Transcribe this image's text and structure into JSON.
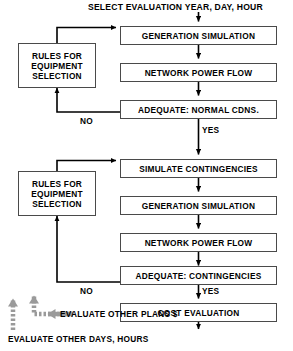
{
  "diagram": {
    "title": "SELECT EVALUATION YEAR, DAY, HOUR",
    "colors": {
      "line": "#000000",
      "box_border": "#4a4a4a",
      "background": "#ffffff",
      "gray_arrow": "#9a9a9a"
    },
    "nodes": {
      "generation_simulation_1": "GENERATION SIMULATION",
      "network_power_flow_1": "NETWORK POWER FLOW",
      "adequate_normal": "ADEQUATE: NORMAL CDNS.",
      "simulate_contingencies": "SIMULATE CONTINGENCIES",
      "generation_simulation_2": "GENERATION SIMULATION",
      "network_power_flow_2": "NETWORK POWER FLOW",
      "adequate_contingencies": "ADEQUATE: CONTINGENCIES",
      "cost_evaluation": "COST EVALUATION",
      "rules_1": {
        "line1": "RULES FOR",
        "line2": "EQUIPMENT",
        "line3": "SELECTION"
      },
      "rules_2": {
        "line1": "RULES FOR",
        "line2": "EQUIPMENT",
        "line3": "SELECTION"
      }
    },
    "edge_labels": {
      "no_1": "NO",
      "yes_1": "YES",
      "no_2": "NO",
      "yes_2": "YES"
    },
    "footer": {
      "evaluate_other_plans": "EVALUATE OTHER PLANS  $",
      "evaluate_other_days": "EVALUATE OTHER DAYS, HOURS"
    }
  }
}
